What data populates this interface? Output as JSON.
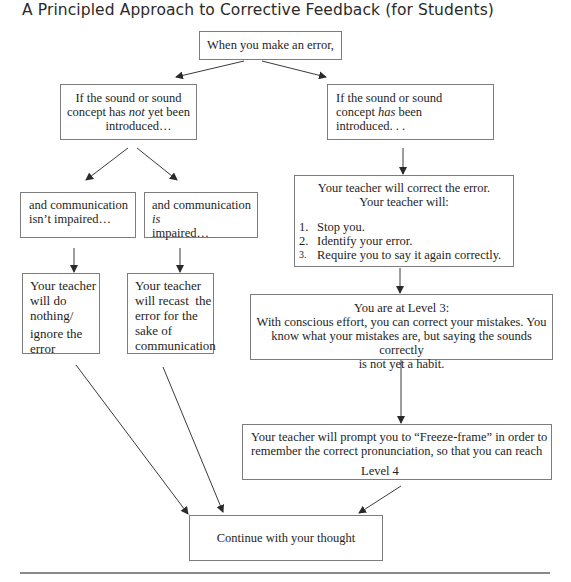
{
  "title": "A Principled Approach to Corrective Feedback (for Students)",
  "nodes": {
    "start": {
      "text": "When you make an error,"
    },
    "not_introduced": {
      "line1": "If the sound or sound",
      "line2_pre": "concept has ",
      "line2_em": "not",
      "line2_post": " yet been",
      "line3": "introduced…"
    },
    "introduced": {
      "line1": "If the sound or sound",
      "line2_pre": "concept ",
      "line2_em": "has",
      "line2_post": " been",
      "line3": "introduced. . ."
    },
    "not_impaired": {
      "line1": "and communication",
      "line2": "isn’t impaired…"
    },
    "impaired": {
      "line1_pre": "and communication ",
      "line1_em": "is",
      "line2": "impaired…"
    },
    "teacher_correct": {
      "line1": "Your teacher will correct the error.",
      "line2": "Your teacher will:",
      "steps": [
        {
          "num": "1.",
          "text": "Stop you."
        },
        {
          "num": "2.",
          "text": "Identify your error."
        },
        {
          "num": "3.",
          "text": "Require you to say it again correctly."
        }
      ]
    },
    "do_nothing": {
      "line1": "Your teacher",
      "line2": "will do",
      "line3": "nothing/",
      "line4": "ignore the",
      "line5": "error"
    },
    "recast": {
      "line1": "Your teacher",
      "line2": "will recast  the",
      "line3": "error for the",
      "line4": "sake of",
      "line5": "communication"
    },
    "level3": {
      "line1": "You are at Level 3:",
      "line2": "With conscious effort, you can correct your mistakes. You",
      "line3": "know what your mistakes are, but saying the sounds correctly",
      "line4": "is not yet a habit."
    },
    "freeze_frame": {
      "line1": "Your teacher will prompt you to “Freeze-frame” in order to",
      "line2": "remember the correct pronunciation, so that you can reach",
      "line3": "Level 4"
    },
    "continue": {
      "text": "Continue with your thought"
    }
  },
  "colors": {
    "line": "#3a3a3a",
    "border": "#7d7d7d",
    "text": "#1e1e1e"
  }
}
